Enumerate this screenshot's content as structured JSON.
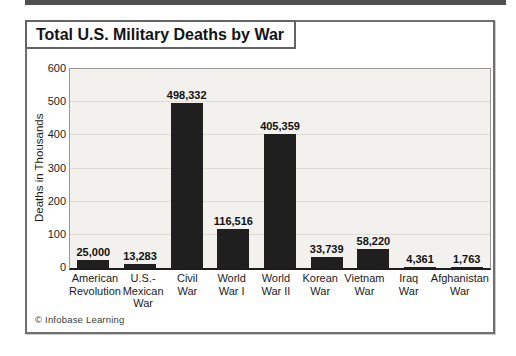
{
  "title": "Total U.S. Military Deaths by War",
  "credit": "© Infobase Learning",
  "chart_data": {
    "type": "bar",
    "title": "Total U.S. Military Deaths by War",
    "xlabel": "",
    "ylabel": "Deaths in Thousands",
    "ylim": [
      0,
      600
    ],
    "yticks": [
      0,
      100,
      200,
      300,
      400,
      500,
      600
    ],
    "grid": true,
    "legend": "none",
    "bar_color": "#1f1f1f",
    "categories": [
      "American Revolution",
      "U.S.-Mexican War",
      "Civil War",
      "World War I",
      "World War II",
      "Korean War",
      "Vietnam War",
      "Iraq War",
      "Afghanistan War"
    ],
    "category_lines": [
      [
        "American",
        "Revolution"
      ],
      [
        "U.S.-",
        "Mexican",
        "War"
      ],
      [
        "Civil",
        "War"
      ],
      [
        "World",
        "War I"
      ],
      [
        "World",
        "War II"
      ],
      [
        "Korean",
        "War"
      ],
      [
        "Vietnam",
        "War"
      ],
      [
        "Iraq",
        "War"
      ],
      [
        "Afghanistan",
        "War"
      ]
    ],
    "values": [
      25000,
      13283,
      498332,
      116516,
      405359,
      33739,
      58220,
      4361,
      1763
    ],
    "value_labels": [
      "25,000",
      "13,283",
      "498,332",
      "116,516",
      "405,359",
      "33,739",
      "58,220",
      "4,361",
      "1,763"
    ]
  }
}
